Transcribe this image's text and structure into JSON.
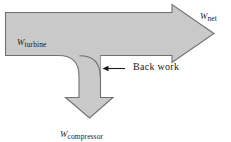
{
  "figure": {
    "background_color": "#ffffff",
    "arrow_fill_color": "#c9c9c9",
    "arrow_stroke_color": "#707070",
    "text_color": "#1a1a1a"
  },
  "labels": {
    "w_net": {
      "symbol": "W",
      "subscript": "net",
      "name": "net work output"
    },
    "w_turbine": {
      "symbol": "W",
      "subscript": "turbine",
      "name": "turbine work"
    },
    "w_compressor": {
      "symbol": "W",
      "subscript": "compressor",
      "name": "compressor work"
    },
    "back_work": {
      "text": "Back work"
    }
  },
  "annotation": {
    "leader_line": {
      "from_x": 125,
      "to_x": 103,
      "y": 68,
      "arrowhead": "left"
    }
  },
  "shapes": {
    "main_arrow": {
      "direction": "right",
      "description": "Horizontal block arrow pointing right, representing turbine work producing net work",
      "body_left": 5,
      "body_top": 12,
      "body_bottom": 55,
      "head_start": 172,
      "tip_x": 214,
      "head_top": 4,
      "head_bottom": 63
    },
    "branch_arrow": {
      "direction": "down",
      "description": "Elbow branch curving down out of main arrow, representing back work to compressor",
      "stem_left": 79,
      "stem_right": 100,
      "head_left": 65,
      "head_right": 113,
      "tip_y": 118
    }
  }
}
